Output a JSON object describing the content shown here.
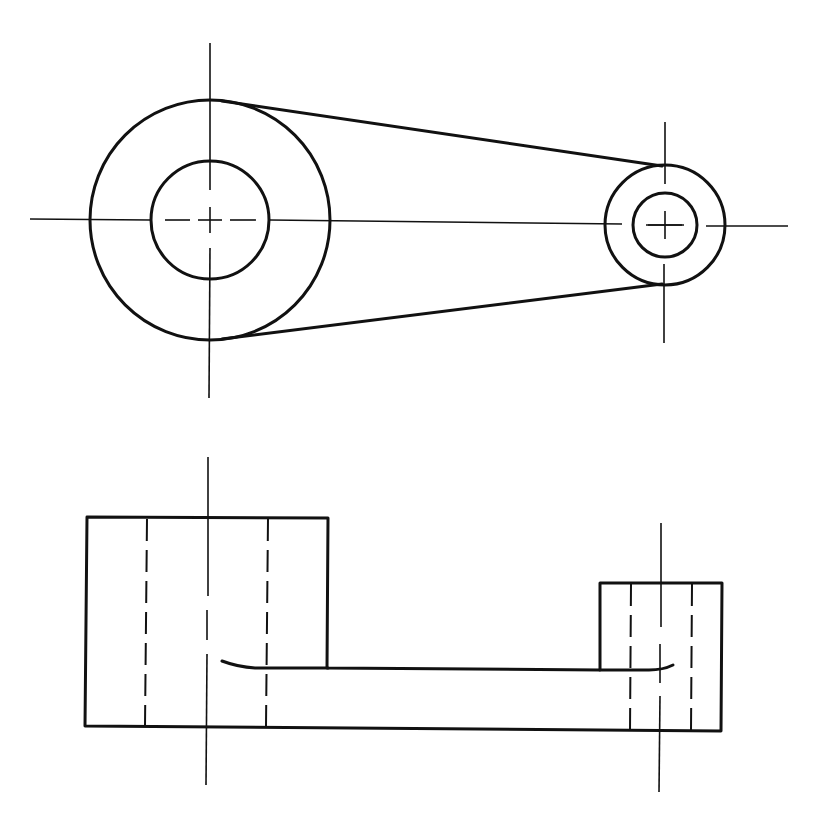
{
  "drawing": {
    "title": "Orthographic views of a crank link",
    "description": "Top view (circles joined by tangent lines) and front view (two bosses connected by a rib), with centerlines and hidden bore lines",
    "line_color": "#111111",
    "background": "#ffffff"
  },
  "top_view": {
    "large_boss": {
      "cx": 210,
      "cy": 220,
      "outer_r": 120,
      "bore_r": 59
    },
    "small_boss": {
      "cx": 665,
      "cy": 225,
      "outer_r": 60,
      "bore_r": 32
    },
    "tangent_lines": [
      {
        "x1": 222,
        "y1": 101,
        "x2": 662,
        "y2": 166
      },
      {
        "x1": 222,
        "y1": 339,
        "x2": 662,
        "y2": 284
      }
    ],
    "centerlines": {
      "horizontal": {
        "x1": 30,
        "x2": 788,
        "y": 220
      },
      "large_vertical": {
        "x": 210,
        "y1": 43,
        "y2": 398
      },
      "small_vertical": {
        "x": 665,
        "y1": 122,
        "y2": 343
      }
    }
  },
  "front_view": {
    "large_boss": {
      "x": 87,
      "y": 518,
      "w": 241,
      "h": 208
    },
    "small_boss": {
      "x": 600,
      "y": 583,
      "w": 122,
      "h": 149
    },
    "rib_top_y": 668,
    "bottom_y": 726,
    "hidden_lines": [
      146,
      267,
      631,
      691
    ],
    "centerlines": [
      {
        "x": 207,
        "y1": 457,
        "y2": 785
      },
      {
        "x": 660,
        "y1": 523,
        "y2": 792
      }
    ]
  }
}
